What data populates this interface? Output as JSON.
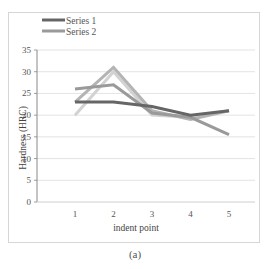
{
  "chart_data": {
    "type": "line",
    "title": "",
    "xlabel": "indent point",
    "ylabel": "Hardness (HRC)",
    "categories": [
      "1",
      "2",
      "3",
      "4",
      "5"
    ],
    "ylim": [
      0,
      35
    ],
    "yticks": [
      0,
      5,
      10,
      15,
      20,
      25,
      30,
      35
    ],
    "grid": true,
    "legend": {
      "placement": "top-left",
      "entries": [
        "Series 1",
        "Series 2"
      ]
    },
    "series": [
      {
        "name": "Series 1",
        "color": "#666666",
        "values": [
          23,
          23,
          22,
          20,
          21
        ]
      },
      {
        "name": "Series 2",
        "color": "#9a9a9a",
        "values": [
          26,
          27,
          20.5,
          19.5,
          15.5
        ]
      },
      {
        "name": "",
        "color": "#b4b4b4",
        "values": [
          23,
          31,
          21,
          19,
          21
        ]
      },
      {
        "name": "",
        "color": "#d2d2d2",
        "values": [
          20,
          30,
          20,
          19.5,
          21
        ]
      }
    ]
  },
  "caption": "(a)"
}
